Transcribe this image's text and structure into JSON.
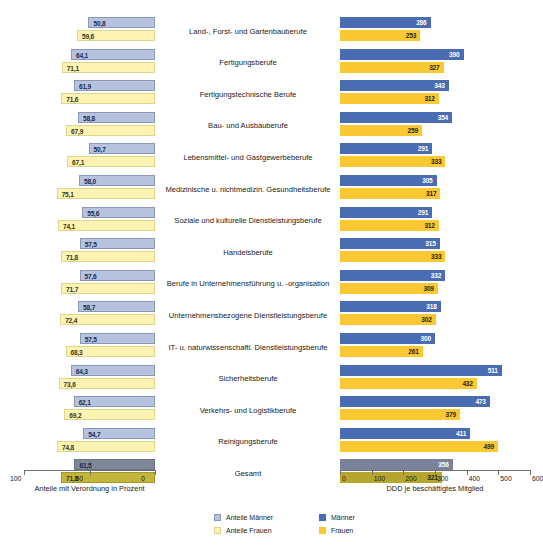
{
  "top_fragment": "",
  "axes": {
    "left": {
      "title": "Anteile mit Verordnung in Prozent",
      "ticks": [
        100,
        50,
        0
      ],
      "min": 0,
      "max": 100,
      "reversed": true
    },
    "right": {
      "title": "DDD je beschäftigtes Mitglied",
      "ticks": [
        0,
        100,
        200,
        300,
        400,
        500,
        600
      ],
      "min": 0,
      "max": 600,
      "reversed": false
    }
  },
  "legend": {
    "items": [
      {
        "label": "Anteile Männer",
        "color": "#b7c2de",
        "swatch": "am"
      },
      {
        "label": "Anteile Frauen",
        "color": "#fdf4b4",
        "swatch": "af"
      },
      {
        "label": "Männer",
        "color": "#4a6cb2",
        "swatch": "mm"
      },
      {
        "label": "Frauen",
        "color": "#fac832",
        "swatch": "ff"
      }
    ]
  },
  "chart_data": {
    "type": "bar",
    "title": "",
    "orientation": "horizontal",
    "layout": "back-to-back dual panel (left: percent reversed, right: DDD)",
    "categories": [
      "Land-, Forst- und Gartenbauberufe",
      "Fertigungsberufe",
      "Fertigungstechnische Berufe",
      "Bau- und Ausbauberufe",
      "Lebensmittel- und Gastgewerbeberufe",
      "Medizinische u. nichtmedizin. Gesundheitsberufe",
      "Soziale und kulturelle Dienstleistungsberufe",
      "Handelsberufe",
      "Berufe in Unternehmensführung u. -organisation",
      "Unternehmensbezogene Dienstleistungsberufe",
      "IT- u. naturwissenschaftl. Dienstleistungsberufe",
      "Sicherheitsberufe",
      "Verkehrs- und Logistikberufe",
      "Reinigungsberufe",
      "Gesamt"
    ],
    "series": [
      {
        "name": "Anteile Männer",
        "panel": "left",
        "unit": "Prozent",
        "color": "#b7c2de",
        "values": [
          50.8,
          64.1,
          61.9,
          58.8,
          50.7,
          58.0,
          55.6,
          57.5,
          57.6,
          58.7,
          57.5,
          64.3,
          62.1,
          54.7,
          61.5
        ],
        "labels": [
          "50,8",
          "64,1",
          "61,9",
          "58,8",
          "50,7",
          "58,0",
          "55,6",
          "57,5",
          "57,6",
          "58,7",
          "57,5",
          "64,3",
          "62,1",
          "54,7",
          "61,5"
        ]
      },
      {
        "name": "Anteile Frauen",
        "panel": "left",
        "unit": "Prozent",
        "color": "#fdf4b4",
        "values": [
          59.6,
          71.1,
          71.6,
          67.9,
          67.1,
          75.1,
          74.1,
          71.8,
          71.7,
          72.4,
          68.3,
          73.6,
          69.2,
          74.8,
          71.8
        ],
        "labels": [
          "59,6",
          "71,1",
          "71,6",
          "67,9",
          "67,1",
          "75,1",
          "74,1",
          "71,8",
          "71,7",
          "72,4",
          "68,3",
          "73,6",
          "69,2",
          "74,8",
          "71,8"
        ]
      },
      {
        "name": "Männer",
        "panel": "right",
        "unit": "DDD je beschäftigtes Mitglied",
        "color": "#4a6cb2",
        "values": [
          286,
          390,
          343,
          354,
          291,
          305,
          291,
          315,
          332,
          318,
          300,
          511,
          473,
          411,
          356
        ],
        "labels": [
          "286",
          "390",
          "343",
          "354",
          "291",
          "305",
          "291",
          "315",
          "332",
          "318",
          "300",
          "511",
          "473",
          "411",
          "356"
        ]
      },
      {
        "name": "Frauen",
        "panel": "right",
        "unit": "DDD je beschäftigtes Mitglied",
        "color": "#fac832",
        "values": [
          253,
          327,
          312,
          259,
          333,
          317,
          312,
          333,
          309,
          302,
          261,
          432,
          379,
          499,
          321
        ],
        "labels": [
          "253",
          "327",
          "312",
          "259",
          "333",
          "317",
          "312",
          "333",
          "309",
          "302",
          "261",
          "432",
          "379",
          "499",
          "321"
        ]
      }
    ],
    "highlight_row": "Gesamt",
    "xlabel_left": "Anteile mit Verordnung in Prozent",
    "xlabel_right": "DDD je beschäftigtes Mitglied",
    "xlim_left": [
      0,
      100
    ],
    "xlim_right": [
      0,
      600
    ],
    "grid": false,
    "legend_position": "bottom-center"
  }
}
